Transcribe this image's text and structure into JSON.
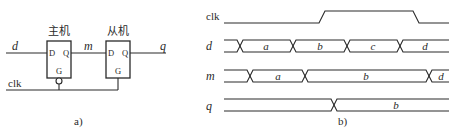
{
  "part_a": {
    "caption": "a)",
    "master": {
      "title": "主机",
      "pin_d": "D",
      "pin_q": "Q",
      "pin_g": "G"
    },
    "slave": {
      "title": "从机",
      "pin_d": "D",
      "pin_q": "Q",
      "pin_g": "G"
    },
    "signals": {
      "input": "d",
      "middle": "m",
      "output": "q",
      "clock": "clk"
    }
  },
  "part_b": {
    "caption": "b)",
    "rows": [
      {
        "name": "clk"
      },
      {
        "name": "d",
        "segments": [
          "a",
          "b",
          "c",
          "d"
        ]
      },
      {
        "name": "m",
        "segments": [
          "a",
          "b",
          "d"
        ]
      },
      {
        "name": "q",
        "segments": [
          "b"
        ]
      }
    ]
  },
  "colors": {
    "ink": "#2a2a2a",
    "background": "#ffffff"
  }
}
